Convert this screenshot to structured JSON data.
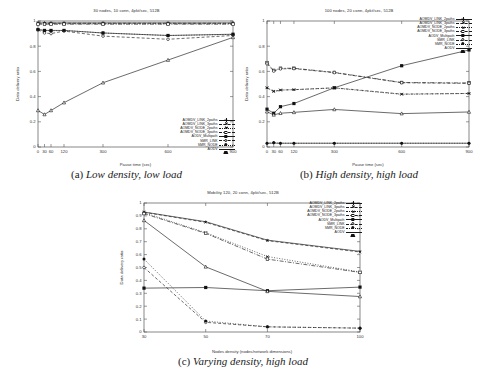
{
  "figure": {
    "kind": "paper-figure",
    "series_names": [
      "AOMDV_LINK_2paths",
      "AOMDV_LINK_3paths",
      "AOMDV_NODE_2paths",
      "AOMDV_NODE_3paths",
      "AODV_Multipath",
      "SMR_LINK",
      "SMR_NODE",
      "AODV"
    ]
  },
  "captions": {
    "a": {
      "num": "(a)",
      "text": "Low density, low load"
    },
    "b": {
      "num": "(b)",
      "text": "High density, high load"
    },
    "c": {
      "num": "(c)",
      "text": "Varying density, high load"
    }
  },
  "chart_data": [
    {
      "id": "a",
      "type": "line",
      "title": "30 nodes, 10 conn, 4pkt/sec, 512B",
      "xlabel": "Pause time (sec)",
      "ylabel": "Data delivery ratio",
      "x": [
        0,
        30,
        60,
        120,
        300,
        600,
        900
      ],
      "xticks": [
        "0",
        "30",
        "60",
        "120",
        "300",
        "600",
        "900"
      ],
      "xlim": [
        0,
        900
      ],
      "ylim": [
        0,
        1
      ],
      "yticks": [
        "0",
        "0.2",
        "0.4",
        "0.6",
        "0.8",
        "1"
      ],
      "grid": false,
      "legend_position": "inside-bottom-right",
      "series": [
        {
          "name": "AOMDV_LINK_2paths",
          "marker": "plus",
          "line": "solid",
          "values": [
            0.985,
            0.985,
            0.985,
            0.985,
            0.985,
            0.985,
            0.985
          ]
        },
        {
          "name": "AOMDV_LINK_3paths",
          "marker": "cross",
          "line": "dashed",
          "values": [
            0.985,
            0.982,
            0.982,
            0.982,
            0.982,
            0.982,
            0.982
          ]
        },
        {
          "name": "AOMDV_NODE_2paths",
          "marker": "star",
          "line": "dotted",
          "values": [
            0.978,
            0.978,
            0.978,
            0.978,
            0.978,
            0.978,
            0.978
          ]
        },
        {
          "name": "AOMDV_NODE_3paths",
          "marker": "sq-open",
          "line": "dashdot",
          "values": [
            0.975,
            0.975,
            0.975,
            0.975,
            0.975,
            0.975,
            0.975
          ]
        },
        {
          "name": "AODV_Multipath",
          "marker": "sq-fill",
          "line": "solid",
          "values": [
            0.932,
            0.925,
            0.925,
            0.925,
            0.905,
            0.885,
            0.895
          ]
        },
        {
          "name": "SMR_LINK",
          "marker": "ci-open",
          "line": "dashed",
          "values": [
            0.93,
            0.905,
            0.9,
            0.92,
            0.88,
            0.855,
            0.885
          ]
        },
        {
          "name": "SMR_NODE",
          "marker": "ci-fill",
          "line": "dotted",
          "values": [
            0.932,
            0.925,
            0.922,
            0.925,
            0.905,
            0.885,
            0.893
          ]
        },
        {
          "name": "AODV",
          "marker": "tri-open",
          "line": "solid",
          "values": [
            0.29,
            0.258,
            0.29,
            0.352,
            0.51,
            0.69,
            0.87
          ]
        }
      ]
    },
    {
      "id": "b",
      "type": "line",
      "title": "100 nodes, 20 conn, 4pkt/sec, 512B",
      "xlabel": "Pause time (sec)",
      "ylabel": "Data delivery ratio",
      "x": [
        0,
        30,
        60,
        120,
        300,
        600,
        900
      ],
      "xticks": [
        "0",
        "30",
        "60",
        "120",
        "300",
        "600",
        "900"
      ],
      "xlim": [
        0,
        900
      ],
      "ylim": [
        0,
        1
      ],
      "yticks": [
        "0",
        "0.2",
        "0.4",
        "0.6",
        "0.8",
        "1"
      ],
      "grid": false,
      "legend_position": "inside-top-right",
      "series": [
        {
          "name": "AOMDV_LINK_2paths",
          "marker": "plus",
          "line": "solid",
          "values": [
            0.03,
            0.03,
            0.03,
            0.03,
            0.03,
            0.03,
            0.03
          ]
        },
        {
          "name": "AOMDV_LINK_3paths",
          "marker": "cross",
          "line": "dashed",
          "values": [
            0.47,
            0.44,
            0.452,
            0.455,
            0.47,
            0.42,
            0.425
          ]
        },
        {
          "name": "AOMDV_NODE_2paths",
          "marker": "star",
          "line": "dotted",
          "values": [
            0.47,
            0.443,
            0.452,
            0.455,
            0.468,
            0.418,
            0.425
          ]
        },
        {
          "name": "AOMDV_NODE_3paths",
          "marker": "sq-open",
          "line": "dashdot",
          "values": [
            0.67,
            0.608,
            0.625,
            0.625,
            0.592,
            0.512,
            0.508
          ]
        },
        {
          "name": "AODV_Multipath",
          "marker": "sq-fill",
          "line": "solid",
          "values": [
            0.3,
            0.268,
            0.32,
            0.345,
            0.47,
            0.645,
            0.77
          ]
        },
        {
          "name": "SMR_LINK",
          "marker": "ci-open",
          "line": "dashed",
          "values": [
            0.66,
            0.602,
            0.62,
            0.622,
            0.59,
            0.51,
            0.505
          ]
        },
        {
          "name": "SMR_NODE",
          "marker": "ci-fill",
          "line": "dotted",
          "values": [
            0.03,
            0.035,
            0.03,
            0.03,
            0.03,
            0.03,
            0.03
          ]
        },
        {
          "name": "AODV",
          "marker": "tri-open",
          "line": "solid",
          "values": [
            0.28,
            0.255,
            0.268,
            0.275,
            0.298,
            0.265,
            0.278
          ]
        }
      ]
    },
    {
      "id": "c",
      "type": "line",
      "title": "Mobility 120, 20 conn, 4pkt/sec, 512B",
      "xlabel": "Nodes density (nodes/network dimensions)",
      "ylabel": "Data delivery ratio",
      "x": [
        30,
        50,
        70,
        100
      ],
      "xticks": [
        "30",
        "50",
        "70",
        "100"
      ],
      "xlim": [
        30,
        100
      ],
      "ylim": [
        0,
        1
      ],
      "yticks": [
        "0",
        "0.1",
        "0.2",
        "0.3",
        "0.4",
        "0.5",
        "0.6",
        "0.7",
        "0.8",
        "0.9",
        "1"
      ],
      "grid": false,
      "legend_position": "inside-top-right",
      "series": [
        {
          "name": "AOMDV_LINK_2paths",
          "marker": "plus",
          "line": "solid",
          "values": [
            0.93,
            0.855,
            0.712,
            0.625
          ]
        },
        {
          "name": "AOMDV_LINK_3paths",
          "marker": "cross",
          "line": "dashed",
          "values": [
            0.928,
            0.85,
            0.708,
            0.62
          ]
        },
        {
          "name": "AOMDV_NODE_2paths",
          "marker": "star",
          "line": "dotted",
          "values": [
            0.925,
            0.77,
            0.585,
            0.465
          ]
        },
        {
          "name": "AOMDV_NODE_3paths",
          "marker": "sq-open",
          "line": "dashdot",
          "values": [
            0.918,
            0.765,
            0.565,
            0.462
          ]
        },
        {
          "name": "AODV_Multipath",
          "marker": "sq-fill",
          "line": "solid",
          "values": [
            0.34,
            0.345,
            0.32,
            0.348
          ]
        },
        {
          "name": "SMR_LINK",
          "marker": "ci-open",
          "line": "dashed",
          "values": [
            0.5,
            0.075,
            0.04,
            0.03
          ]
        },
        {
          "name": "SMR_NODE",
          "marker": "ci-fill",
          "line": "dotted",
          "values": [
            0.565,
            0.085,
            0.04,
            0.03
          ]
        },
        {
          "name": "AODV",
          "marker": "tri-open",
          "line": "solid",
          "values": [
            0.865,
            0.505,
            0.315,
            0.275
          ]
        }
      ]
    }
  ]
}
